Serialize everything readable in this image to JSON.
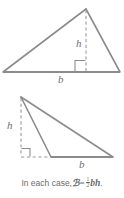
{
  "figure": {
    "stroke_color": "#8c8c8c",
    "text_color": "#6b6b6b",
    "background_color": "#ffffff",
    "triangles": [
      {
        "id": "acute-triangle",
        "description": "Acute triangle with altitude drawn inside from apex to base",
        "height_label": "h",
        "base_label": "b",
        "right_angle_marked": true,
        "vertices": [
          [
            3,
            72
          ],
          [
            86,
            9
          ],
          [
            120,
            72
          ]
        ],
        "altitude_foot": [
          86,
          72
        ],
        "altitude_apex": [
          86,
          9
        ]
      },
      {
        "id": "obtuse-triangle",
        "description": "Obtuse triangle with altitude drawn outside, base extended with dashes",
        "height_label": "h",
        "base_label": "b",
        "right_angle_marked": true,
        "vertices": [
          [
            21,
            97
          ],
          [
            51,
            157
          ],
          [
            113,
            157
          ]
        ],
        "altitude_foot": [
          21,
          157
        ],
        "altitude_apex": [
          21,
          97
        ],
        "base_extension": [
          [
            21,
            157
          ],
          [
            51,
            157
          ]
        ]
      }
    ],
    "labels": [
      {
        "id": "h-label-top",
        "text": "h",
        "x": 76,
        "y": 40
      },
      {
        "id": "b-label-top",
        "text": "b",
        "x": 58,
        "y": 76
      },
      {
        "id": "h-label-bottom",
        "text": "h",
        "x": 8,
        "y": 122
      },
      {
        "id": "b-label-bottom",
        "text": "b",
        "x": 79,
        "y": 161
      }
    ],
    "caption": {
      "lead_text": "In each case,",
      "area_symbol": "ℬ",
      "area_symbol_plain": "A",
      "equals": "=",
      "fraction_numerator": "1",
      "fraction_denominator": "2",
      "expression": "bh",
      "terminator": ".",
      "full_text": "In each case, A = 1/2 bh."
    }
  }
}
